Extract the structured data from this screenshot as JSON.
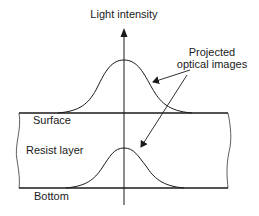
{
  "diagram": {
    "axis_label": "Light intensity",
    "callout_label_line1": "Projected",
    "callout_label_line2": "optical images",
    "surface_label": "Surface",
    "resist_label": "Resist layer",
    "bottom_label": "Bottom",
    "colors": {
      "line": "#1a1a1a",
      "background": "#ffffff"
    }
  }
}
